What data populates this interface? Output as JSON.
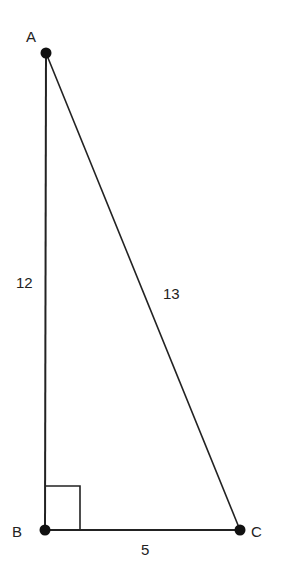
{
  "diagram": {
    "type": "right-triangle",
    "vertices": [
      {
        "id": "A",
        "label": "A",
        "x": 46,
        "y": 53
      },
      {
        "id": "B",
        "label": "B",
        "x": 45,
        "y": 530
      },
      {
        "id": "C",
        "label": "C",
        "x": 240,
        "y": 530
      }
    ],
    "sides": [
      {
        "from": "A",
        "to": "B",
        "label": "12"
      },
      {
        "from": "A",
        "to": "C",
        "label": "13"
      },
      {
        "from": "B",
        "to": "C",
        "label": "5"
      }
    ],
    "right_angle_at": "B",
    "colors": {
      "stroke": "#222222",
      "point": "#111111",
      "background": "#ffffff"
    }
  }
}
